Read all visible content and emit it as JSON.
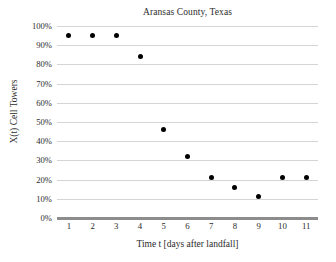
{
  "chart_data": {
    "type": "scatter",
    "title": "Aransas County, Texas",
    "xlabel": "Time t [days after landfall]",
    "ylabel": "X(t) Cell Towers",
    "x": [
      1,
      2,
      3,
      4,
      5,
      6,
      7,
      8,
      9,
      10,
      11
    ],
    "values": [
      95,
      95,
      95,
      84,
      46,
      32,
      21,
      16,
      11,
      21,
      21
    ],
    "point_labels": [
      "95%",
      "95%",
      "95%",
      "84%",
      "46%",
      "32%",
      "21%",
      "16%",
      "11%",
      "21%",
      "21%"
    ],
    "x_tick_labels": [
      "1",
      "2",
      "3",
      "4",
      "5",
      "6",
      "7",
      "8",
      "9",
      "10",
      "11"
    ],
    "y_tick_labels": [
      "0%",
      "10%",
      "20%",
      "30%",
      "40%",
      "50%",
      "60%",
      "70%",
      "80%",
      "90%",
      "100%"
    ],
    "y_tick_values": [
      0,
      10,
      20,
      30,
      40,
      50,
      60,
      70,
      80,
      90,
      100
    ],
    "xlim": [
      0.5,
      11.5
    ],
    "ylim": [
      0,
      100
    ],
    "grid": "horizontal",
    "legend": "none",
    "marker_color": "#000000",
    "gridline_color": "#d4d4d4",
    "axis_color": "#8c8c8c",
    "background_color": "#ffffff"
  }
}
